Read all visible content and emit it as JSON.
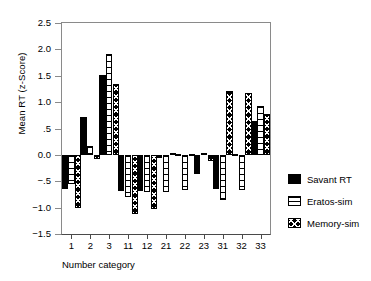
{
  "chart_data": {
    "type": "bar",
    "title": "",
    "xlabel": "Number category",
    "ylabel": "Mean RT (z-Score)",
    "categories": [
      "1",
      "2",
      "3",
      "11",
      "12",
      "21",
      "22",
      "23",
      "31",
      "32",
      "33"
    ],
    "ylim": [
      -1.5,
      2.5
    ],
    "ytick_values": [
      2.5,
      2.0,
      1.5,
      1.0,
      0.5,
      0.0,
      -0.5,
      -1.0,
      -1.5
    ],
    "ytick_labels": [
      "2.5",
      "2.0",
      "1.5",
      "1.0",
      ".5",
      "0.0",
      "−.5",
      "−1.0",
      "−1.5"
    ],
    "grid": false,
    "legend_position": "right",
    "series": [
      {
        "name": "Savant RT",
        "fill": "solid-black",
        "values": [
          -0.64,
          0.72,
          1.52,
          -0.68,
          -0.69,
          -0.06,
          0.0,
          -0.37,
          -0.65,
          0.0,
          0.65
        ]
      },
      {
        "name": "Eratos-sim",
        "fill": "white-horizontal-lines",
        "values": [
          -0.55,
          0.17,
          1.91,
          -0.79,
          -0.7,
          -0.71,
          -0.66,
          0.04,
          -0.85,
          -0.66,
          0.93
        ]
      },
      {
        "name": "Memory-sim",
        "fill": "black-white-cross",
        "values": [
          -1.01,
          -0.07,
          1.34,
          -1.13,
          -1.03,
          0.03,
          0.0,
          -0.12,
          1.22,
          1.18,
          0.77
        ]
      }
    ]
  },
  "legend": {
    "items": [
      {
        "label": "Savant RT"
      },
      {
        "label": "Eratos-sim"
      },
      {
        "label": "Memory-sim"
      }
    ]
  }
}
